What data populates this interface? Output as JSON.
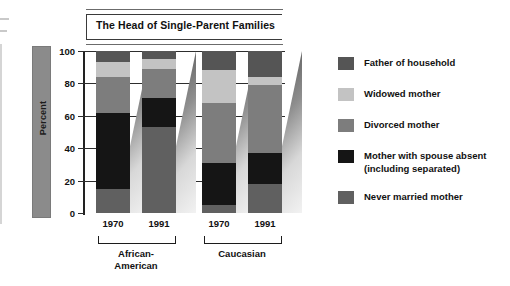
{
  "chart": {
    "title": "The Head of Single-Parent Families",
    "y_axis_label": "Percent",
    "y_ticks": [
      "100",
      "80",
      "60",
      "40",
      "20",
      "0"
    ],
    "x_tick_labels": [
      "1970",
      "1991",
      "1970",
      "1991"
    ],
    "group_labels": [
      "African-\nAmerican",
      "Caucasian"
    ],
    "group_label_1": "African-",
    "group_label_1b": "American",
    "group_label_2": "Caucasian"
  },
  "legend": {
    "items": [
      {
        "label": "Father of household",
        "color": "#555555"
      },
      {
        "label": "Widowed mother",
        "color": "#c3c3c3"
      },
      {
        "label": "Divorced mother",
        "color": "#7d7d7d"
      },
      {
        "label": "Mother with spouse absent",
        "label2": "(including separated)",
        "color": "#151515"
      },
      {
        "label": "Never married mother",
        "color": "#606060"
      }
    ]
  },
  "chart_data": {
    "type": "bar",
    "subtype": "stacked-vertical-100",
    "title": "The Head of Single-Parent Families",
    "xlabel": "",
    "ylabel": "Percent",
    "ylim": [
      0,
      100
    ],
    "yticks": [
      0,
      20,
      40,
      60,
      80,
      100
    ],
    "grid": true,
    "legend_position": "right",
    "categories": [
      "1970",
      "1991",
      "1970",
      "1991"
    ],
    "groups": [
      "African-American",
      "African-American",
      "Caucasian",
      "Caucasian"
    ],
    "series": [
      {
        "name": "Father of household",
        "color": "#555555",
        "values": [
          7,
          5,
          12,
          16
        ]
      },
      {
        "name": "Widowed mother",
        "color": "#c3c3c3",
        "values": [
          9,
          6,
          20,
          5
        ]
      },
      {
        "name": "Divorced mother",
        "color": "#7d7d7d",
        "values": [
          22,
          18,
          37,
          42
        ]
      },
      {
        "name": "Mother with spouse absent (including separated)",
        "color": "#151515",
        "values": [
          47,
          18,
          26,
          19
        ]
      },
      {
        "name": "Never married mother",
        "color": "#606060",
        "values": [
          15,
          53,
          5,
          18
        ]
      }
    ],
    "bars": [
      {
        "group": "African-American",
        "year": "1970",
        "segments": [
          {
            "name": "Father of household",
            "value": 7,
            "from": 93,
            "to": 100
          },
          {
            "name": "Widowed mother",
            "value": 9,
            "from": 84,
            "to": 93
          },
          {
            "name": "Divorced mother",
            "value": 22,
            "from": 62,
            "to": 84
          },
          {
            "name": "Mother with spouse absent",
            "value": 47,
            "from": 15,
            "to": 62
          },
          {
            "name": "Never married mother",
            "value": 15,
            "from": 0,
            "to": 15
          }
        ]
      },
      {
        "group": "African-American",
        "year": "1991",
        "segments": [
          {
            "name": "Father of household",
            "value": 5,
            "from": 95,
            "to": 100
          },
          {
            "name": "Widowed mother",
            "value": 6,
            "from": 89,
            "to": 95
          },
          {
            "name": "Divorced mother",
            "value": 18,
            "from": 71,
            "to": 89
          },
          {
            "name": "Mother with spouse absent",
            "value": 18,
            "from": 53,
            "to": 71
          },
          {
            "name": "Never married mother",
            "value": 53,
            "from": 0,
            "to": 53
          }
        ]
      },
      {
        "group": "Caucasian",
        "year": "1970",
        "segments": [
          {
            "name": "Father of household",
            "value": 12,
            "from": 88,
            "to": 100
          },
          {
            "name": "Widowed mother",
            "value": 20,
            "from": 68,
            "to": 88
          },
          {
            "name": "Divorced mother",
            "value": 37,
            "from": 31,
            "to": 68
          },
          {
            "name": "Mother with spouse absent",
            "value": 26,
            "from": 5,
            "to": 31
          },
          {
            "name": "Never married mother",
            "value": 5,
            "from": 0,
            "to": 5
          }
        ]
      },
      {
        "group": "Caucasian",
        "year": "1991",
        "segments": [
          {
            "name": "Father of household",
            "value": 16,
            "from": 84,
            "to": 100
          },
          {
            "name": "Widowed mother",
            "value": 5,
            "from": 79,
            "to": 84
          },
          {
            "name": "Divorced mother",
            "value": 42,
            "from": 37,
            "to": 79
          },
          {
            "name": "Mother with spouse absent",
            "value": 19,
            "from": 18,
            "to": 37
          },
          {
            "name": "Never married mother",
            "value": 18,
            "from": 0,
            "to": 18
          }
        ]
      }
    ]
  }
}
